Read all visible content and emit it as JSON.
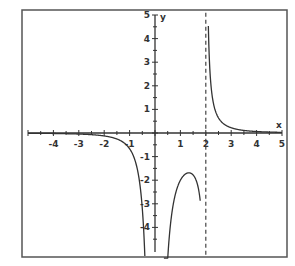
{
  "chart_data": {
    "type": "line",
    "title": "",
    "xlabel": "x",
    "ylabel": "y",
    "xlim": [
      -5,
      5
    ],
    "ylim": [
      -5,
      5
    ],
    "x_ticks": [
      "-4",
      "-3",
      "-2",
      "-1",
      "1",
      "2",
      "3",
      "4",
      "5"
    ],
    "y_ticks": [
      "5",
      "4",
      "3",
      "2",
      "1",
      "-1",
      "-2",
      "-3",
      "-4"
    ],
    "grid": false,
    "vertical_asymptotes": [
      0,
      2
    ],
    "horizontal_asymptote": 0,
    "asymptote_style": "dashed at x=2",
    "series": [
      {
        "name": "left branch",
        "x": [
          -5,
          -4,
          -3,
          -2,
          -1,
          -0.75,
          -0.5,
          -0.4,
          -0.3
        ],
        "y": [
          -0.02,
          -0.04,
          -0.08,
          -0.13,
          -0.3,
          -0.55,
          -1.1,
          -1.6,
          -4.9
        ]
      },
      {
        "name": "middle branch",
        "x": [
          0.3,
          0.5,
          0.75,
          1,
          1.25,
          1.5,
          1.75,
          1.85
        ],
        "y": [
          -5,
          -3.1,
          -2.2,
          -1.95,
          -2.0,
          -2.6,
          -3.8,
          -5
        ]
      },
      {
        "name": "right branch",
        "x": [
          2.05,
          2.2,
          2.5,
          3,
          3.5,
          4,
          4.5,
          5
        ],
        "y": [
          5,
          2.5,
          1.1,
          0.45,
          0.22,
          0.12,
          0.07,
          0.04
        ]
      }
    ]
  },
  "axes": {
    "x_label": "x",
    "y_label": "y"
  }
}
